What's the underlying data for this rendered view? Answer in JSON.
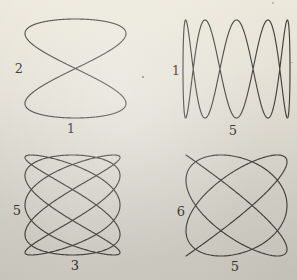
{
  "canvas": {
    "paper_top_color": "#ece8dc",
    "paper_bottom_color": "#d1cec6",
    "ink_color": "#34322d"
  },
  "figures": [
    {
      "name": "lissajous-2-1",
      "left_label": "2",
      "bottom_label": "1",
      "x_frequency": 2,
      "y_frequency": 1,
      "x_phase": 0,
      "y_phase": 0
    },
    {
      "name": "lissajous-1-5",
      "left_label": "1",
      "bottom_label": "5",
      "x_frequency": 1,
      "y_frequency": 5,
      "x_phase": 0,
      "y_phase": 1.5707963
    },
    {
      "name": "lissajous-5-3",
      "left_label": "5",
      "bottom_label": "3",
      "x_frequency": 5,
      "y_frequency": 3,
      "x_phase": 1.5707963,
      "y_phase": 0
    },
    {
      "name": "lissajous-6-5",
      "left_label": "6",
      "bottom_label": "5",
      "x_frequency": 6,
      "y_frequency": 5,
      "x_phase": 1.5707963,
      "y_phase": 0
    }
  ]
}
